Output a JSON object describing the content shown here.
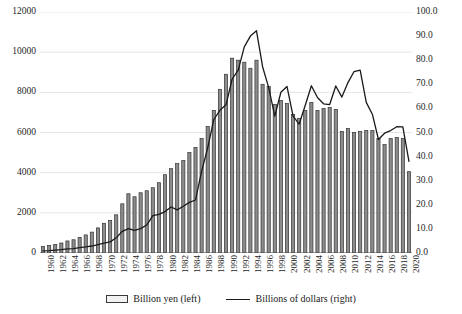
{
  "chart_data": {
    "type": "bar",
    "title": "",
    "subtitle": "",
    "xlabel": "",
    "ylabel": "",
    "grid": true,
    "legend_position": "bottom",
    "x": [
      1960,
      1961,
      1962,
      1963,
      1964,
      1965,
      1966,
      1967,
      1968,
      1969,
      1970,
      1971,
      1972,
      1973,
      1974,
      1975,
      1976,
      1977,
      1978,
      1979,
      1980,
      1981,
      1982,
      1983,
      1984,
      1985,
      1986,
      1987,
      1988,
      1989,
      1990,
      1991,
      1992,
      1993,
      1994,
      1995,
      1996,
      1997,
      1998,
      1999,
      2000,
      2001,
      2002,
      2003,
      2004,
      2005,
      2006,
      2007,
      2008,
      2009,
      2010,
      2011,
      2012,
      2013,
      2014,
      2015,
      2016,
      2017,
      2018,
      2019,
      2020
    ],
    "categories": [
      "1960",
      "1961",
      "1962",
      "1963",
      "1964",
      "1965",
      "1966",
      "1967",
      "1968",
      "1969",
      "1970",
      "1971",
      "1972",
      "1973",
      "1974",
      "1975",
      "1976",
      "1977",
      "1978",
      "1979",
      "1980",
      "1981",
      "1982",
      "1983",
      "1984",
      "1985",
      "1986",
      "1987",
      "1988",
      "1989",
      "1990",
      "1991",
      "1992",
      "1993",
      "1994",
      "1995",
      "1996",
      "1997",
      "1998",
      "1999",
      "2000",
      "2001",
      "2002",
      "2003",
      "2004",
      "2005",
      "2006",
      "2007",
      "2008",
      "2009",
      "2010",
      "2011",
      "2012",
      "2013",
      "2014",
      "2015",
      "2016",
      "2017",
      "2018",
      "2019",
      "2020"
    ],
    "xtick_labels": [
      "1960",
      "1962",
      "1964",
      "1966",
      "1968",
      "1970",
      "1972",
      "1974",
      "1976",
      "1978",
      "1980",
      "1982",
      "1984",
      "1986",
      "1988",
      "1990",
      "1992",
      "1994",
      "1996",
      "1998",
      "2000",
      "2002",
      "2004",
      "2006",
      "2008",
      "2010",
      "2012",
      "2014",
      "2016",
      "2018",
      "2020"
    ],
    "xtick_step": 2,
    "ylim": [
      0,
      12000
    ],
    "yticks": [
      0,
      2000,
      4000,
      6000,
      8000,
      10000,
      12000
    ],
    "ytick_labels": [
      "0",
      "2000",
      "4000",
      "6000",
      "8000",
      "10000",
      "12000"
    ],
    "y2lim": [
      0,
      100
    ],
    "y2ticks": [
      0,
      10,
      20,
      30,
      40,
      50,
      60,
      70,
      80,
      90,
      100
    ],
    "y2tick_labels": [
      "0.0",
      "10.0",
      "20.0",
      "30.0",
      "40.0",
      "50.0",
      "60.0",
      "70.0",
      "80.0",
      "90.0",
      "100.0"
    ],
    "series": [
      {
        "name": "Billion yen (left)",
        "type": "bar",
        "axis": "left",
        "color": "#8c8c8c",
        "edge_color": "#333333",
        "values": [
          330,
          380,
          430,
          500,
          600,
          660,
          780,
          900,
          1040,
          1250,
          1480,
          1620,
          1900,
          2450,
          2950,
          2800,
          3000,
          3100,
          3250,
          3500,
          3900,
          4200,
          4450,
          4600,
          5000,
          5250,
          5700,
          6300,
          7100,
          8150,
          8900,
          9700,
          9600,
          9500,
          9200,
          9600,
          8400,
          8300,
          7400,
          7600,
          7450,
          6900,
          6700,
          7100,
          7500,
          7100,
          7200,
          7250,
          7150,
          6050,
          6200,
          6000,
          6050,
          6100,
          6100,
          5700,
          5400,
          5700,
          5750,
          5700,
          4050
        ]
      },
      {
        "name": "Billions of dollars (right)",
        "type": "line",
        "axis": "right",
        "color": "#1a1a1a",
        "values": [
          0.9,
          1.0,
          1.2,
          1.4,
          1.7,
          1.8,
          2.2,
          2.5,
          2.9,
          3.5,
          4.1,
          4.6,
          6.3,
          9.0,
          10.1,
          9.4,
          10.1,
          11.6,
          15.5,
          16.0,
          17.2,
          19.1,
          17.9,
          19.4,
          21.0,
          22.0,
          33.9,
          43.6,
          55.4,
          59.2,
          61.5,
          72.1,
          75.9,
          85.5,
          90.0,
          92.2,
          77.3,
          68.6,
          56.8,
          66.7,
          69.1,
          56.8,
          53.5,
          61.3,
          69.4,
          64.5,
          61.9,
          61.6,
          69.3,
          64.7,
          70.7,
          75.3,
          75.9,
          62.5,
          57.6,
          47.1,
          49.7,
          50.8,
          52.4,
          52.3,
          38.0
        ]
      }
    ]
  },
  "legend": {
    "entries": [
      {
        "label": "Billion yen (left)",
        "marker": "bar-swatch"
      },
      {
        "label": "Billions of dollars (right)",
        "marker": "line-swatch"
      }
    ]
  }
}
